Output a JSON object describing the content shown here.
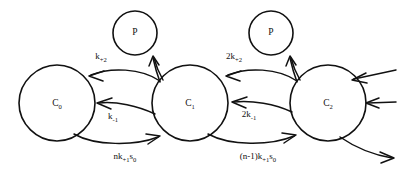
{
  "diagram": {
    "kind": "reaction-scheme",
    "title": "",
    "background_color": "#ffffff",
    "ink_color": "#111111",
    "nodes": [
      {
        "id": "c0",
        "label": "C",
        "sub": "0",
        "cx": 57,
        "cy": 103,
        "r": 38
      },
      {
        "id": "c1",
        "label": "C",
        "sub": "1",
        "cx": 190,
        "cy": 103,
        "r": 38
      },
      {
        "id": "c2",
        "label": "C",
        "sub": "2",
        "cx": 328,
        "cy": 103,
        "r": 38
      },
      {
        "id": "p1",
        "label": "P",
        "sub": "",
        "cx": 135,
        "cy": 33,
        "r": 22
      },
      {
        "id": "p2",
        "label": "P",
        "sub": "",
        "cx": 271,
        "cy": 33,
        "r": 22
      }
    ],
    "rate_labels": [
      {
        "id": "k-plus-2",
        "text": "k",
        "sub": "+2",
        "pre": "",
        "post": "",
        "x": 101,
        "y": 57
      },
      {
        "id": "two-k-plus-2",
        "text": "k",
        "sub": "+2",
        "pre": "2",
        "post": "",
        "x": 234,
        "y": 57
      },
      {
        "id": "k-minus-1",
        "text": "k",
        "sub": "-1",
        "pre": "",
        "post": "",
        "x": 113,
        "y": 117
      },
      {
        "id": "two-k-minus-1",
        "text": "k",
        "sub": "-1",
        "pre": "2",
        "post": "",
        "x": 249,
        "y": 115
      },
      {
        "id": "n-k-plus-1-s0",
        "text": "k",
        "sub": "+1",
        "pre": "n",
        "post": "s",
        "post_sub": "0",
        "x": 125,
        "y": 157
      },
      {
        "id": "n-1-k-plus-1-s0",
        "text": "k",
        "sub": "+1",
        "pre": "(n-1)",
        "post": "s",
        "post_sub": "0",
        "x": 258,
        "y": 157
      }
    ],
    "edges": [
      {
        "id": "c1-to-c0-top",
        "from": "c1",
        "to": "c0",
        "rate": "k-plus-2"
      },
      {
        "id": "c1-to-p1",
        "from": "c1",
        "to": "p1",
        "rate": "k-plus-2"
      },
      {
        "id": "c2-to-c1-top",
        "from": "c2",
        "to": "c1",
        "rate": "two-k-plus-2"
      },
      {
        "id": "c2-to-p2",
        "from": "c2",
        "to": "p2",
        "rate": "two-k-plus-2"
      },
      {
        "id": "c1-to-c0-mid",
        "from": "c1",
        "to": "c0",
        "rate": "k-minus-1"
      },
      {
        "id": "c2-to-c1-mid",
        "from": "c2",
        "to": "c1",
        "rate": "two-k-minus-1"
      },
      {
        "id": "c0-to-c1-bottom",
        "from": "c0",
        "to": "c1",
        "rate": "n-k-plus-1-s0"
      },
      {
        "id": "c1-to-c2-bottom",
        "from": "c1",
        "to": "c2",
        "rate": "n-1-k-plus-1-s0"
      },
      {
        "id": "inflow-upper-c2",
        "from": "",
        "to": "c2",
        "rate": ""
      },
      {
        "id": "inflow-lower-c2",
        "from": "",
        "to": "c2",
        "rate": ""
      },
      {
        "id": "outflow-c2",
        "from": "c2",
        "to": "",
        "rate": ""
      }
    ]
  }
}
